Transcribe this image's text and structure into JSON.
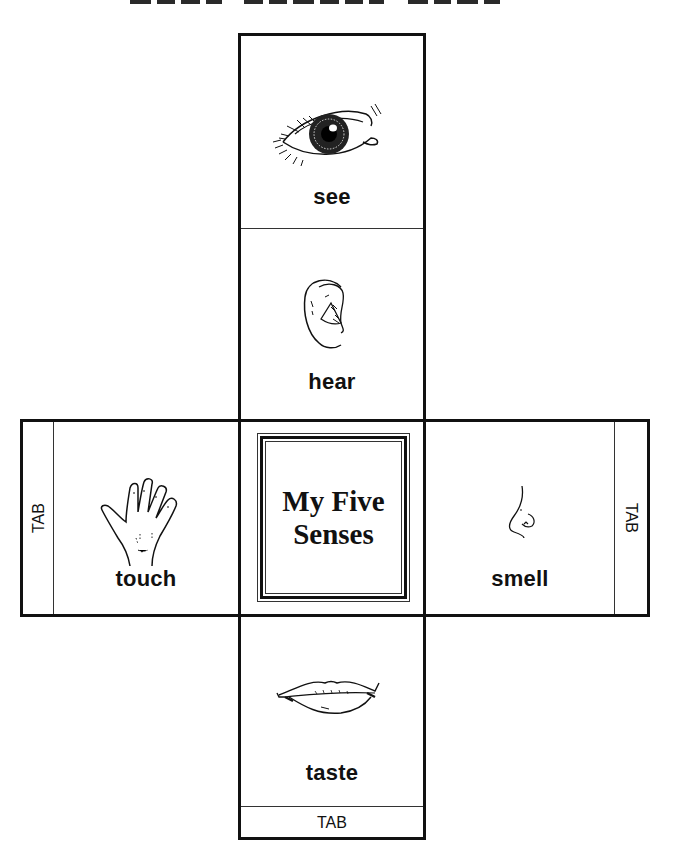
{
  "page": {
    "title_visible": "",
    "title_note": "title clipped at top edge — only bottom of letters visible"
  },
  "cube": {
    "center": {
      "line1": "My Five",
      "line2": "Senses"
    },
    "faces": [
      {
        "id": "see",
        "label": "see",
        "icon": "eye-icon"
      },
      {
        "id": "hear",
        "label": "hear",
        "icon": "ear-icon"
      },
      {
        "id": "touch",
        "label": "touch",
        "icon": "hand-icon"
      },
      {
        "id": "smell",
        "label": "smell",
        "icon": "nose-icon"
      },
      {
        "id": "taste",
        "label": "taste",
        "icon": "lips-icon"
      }
    ],
    "tabs": {
      "left": "TAB",
      "right": "TAB",
      "bottom": "TAB"
    }
  },
  "colors": {
    "line": "#111111",
    "background": "#ffffff"
  }
}
